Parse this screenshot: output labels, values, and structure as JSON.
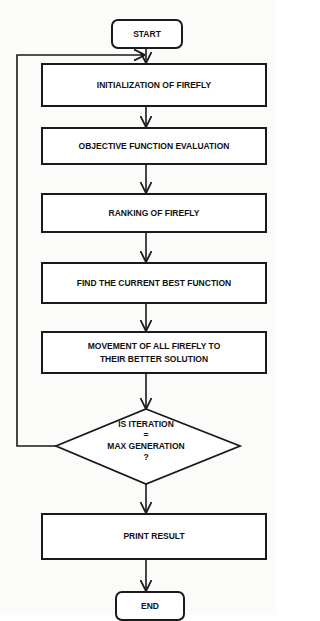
{
  "flowchart": {
    "start": "START",
    "steps": [
      "INITIALIZATION OF FIREFLY",
      "OBJECTIVE FUNCTION EVALUATION",
      "RANKING OF FIREFLY",
      "FIND THE CURRENT BEST FUNCTION",
      "MOVEMENT OF ALL FIREFLY TO THEIR BETTER SOLUTION"
    ],
    "decision": {
      "line1": "IS ITERATION",
      "line2": "=",
      "line3": "MAX GENERATION",
      "line4": "?"
    },
    "output": "PRINT RESULT",
    "end": "END"
  },
  "colors": {
    "stroke": "#1a1a1a",
    "text": "#111111",
    "background": "#ffffff"
  }
}
